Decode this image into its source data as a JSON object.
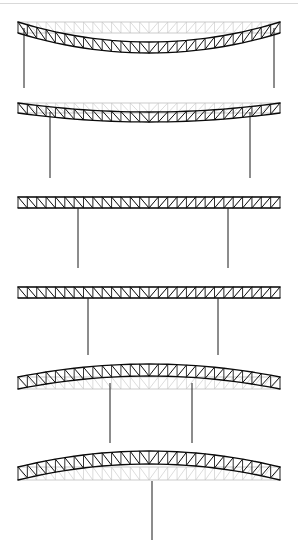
{
  "figure": {
    "width": 298,
    "height": 545,
    "background_color": "#ffffff",
    "reference_color": "#bcbcbc",
    "deformed_color": "#0a0a0a",
    "support_color": "#1a1a1a"
  },
  "chart_data": {
    "type": "line",
    "xlabel": "",
    "ylabel": "",
    "grid": false,
    "legend": [
      "undeformed reference truss",
      "deformed truss"
    ],
    "legend_position": "none",
    "xlim": [
      0,
      298
    ],
    "ylim": [
      0,
      545
    ],
    "series": [
      {
        "name": "panel-1-top-chord-deformed",
        "x": [
          18,
          46,
          74,
          102,
          130,
          158,
          186,
          214,
          242,
          270
        ],
        "y": [
          24,
          30,
          36,
          40,
          42,
          42,
          40,
          36,
          30,
          24
        ]
      },
      {
        "name": "panel-1-bottom-chord-deformed",
        "x": [
          18,
          46,
          74,
          102,
          130,
          158,
          186,
          214,
          242,
          270
        ],
        "y": [
          34,
          40,
          46,
          50,
          52,
          52,
          50,
          46,
          40,
          34
        ]
      },
      {
        "name": "panel-2-top-chord-deformed",
        "x": [
          18,
          46,
          74,
          102,
          130,
          158,
          186,
          214,
          242,
          270
        ],
        "y": [
          105,
          108,
          111,
          113,
          114,
          114,
          113,
          111,
          108,
          105
        ]
      },
      {
        "name": "panel-3-top-chord-deformed",
        "x": [
          18,
          46,
          74,
          102,
          130,
          158,
          186,
          214,
          242,
          270
        ],
        "y": [
          199,
          199,
          199,
          199,
          199,
          199,
          199,
          199,
          199,
          199
        ]
      },
      {
        "name": "panel-4-top-chord-deformed",
        "x": [
          18,
          46,
          74,
          102,
          130,
          158,
          186,
          214,
          242,
          270
        ],
        "y": [
          289,
          289,
          289,
          289,
          289,
          289,
          289,
          289,
          289,
          289
        ]
      },
      {
        "name": "panel-5-top-chord-deformed",
        "x": [
          18,
          46,
          74,
          102,
          130,
          158,
          186,
          214,
          242,
          270
        ],
        "y": [
          390,
          386,
          382,
          379,
          377,
          377,
          379,
          382,
          386,
          390
        ]
      },
      {
        "name": "panel-6-top-chord-deformed",
        "x": [
          18,
          46,
          74,
          102,
          130,
          158,
          186,
          214,
          242,
          270
        ],
        "y": [
          489,
          484,
          480,
          477,
          475,
          475,
          477,
          480,
          484,
          489
        ]
      }
    ]
  },
  "panels": [
    {
      "id": "panel-1",
      "name": "simply-supported-end-columns-sagging",
      "label": "Diagram 1",
      "span_left": 18,
      "span_right": 280,
      "reference_top_y": 22,
      "reference_depth": 11,
      "bays": 28,
      "camber": 20,
      "camber_direction": "sag",
      "columns": [
        {
          "x": 24,
          "top": 28,
          "bottom": 88
        },
        {
          "x": 274,
          "top": 28,
          "bottom": 88
        }
      ]
    },
    {
      "id": "panel-2",
      "name": "two-interior-columns-slight-sag",
      "label": "Diagram 2",
      "span_left": 18,
      "span_right": 280,
      "reference_top_y": 103,
      "reference_depth": 10,
      "bays": 28,
      "camber": 9,
      "camber_direction": "sag",
      "columns": [
        {
          "x": 50,
          "top": 112,
          "bottom": 178
        },
        {
          "x": 250,
          "top": 112,
          "bottom": 178
        }
      ]
    },
    {
      "id": "panel-3",
      "name": "two-interior-columns-straight",
      "label": "Diagram 3",
      "span_left": 18,
      "span_right": 280,
      "reference_top_y": 197,
      "reference_depth": 11,
      "bays": 28,
      "camber": 0,
      "camber_direction": "none",
      "columns": [
        {
          "x": 78,
          "top": 208,
          "bottom": 268
        },
        {
          "x": 228,
          "top": 208,
          "bottom": 268
        }
      ]
    },
    {
      "id": "panel-4",
      "name": "two-interior-columns-straight-wide",
      "label": "Diagram 4",
      "span_left": 18,
      "span_right": 280,
      "reference_top_y": 287,
      "reference_depth": 11,
      "bays": 28,
      "camber": 0,
      "camber_direction": "none",
      "columns": [
        {
          "x": 88,
          "top": 298,
          "bottom": 355
        },
        {
          "x": 218,
          "top": 298,
          "bottom": 355
        }
      ]
    },
    {
      "id": "panel-5",
      "name": "two-interior-columns-hogging",
      "label": "Diagram 5",
      "span_left": 18,
      "span_right": 280,
      "reference_top_y": 377,
      "reference_depth": 12,
      "bays": 28,
      "camber": 13,
      "camber_direction": "hog",
      "columns": [
        {
          "x": 110,
          "top": 383,
          "bottom": 443
        },
        {
          "x": 192,
          "top": 383,
          "bottom": 443
        }
      ]
    },
    {
      "id": "panel-6",
      "name": "single-central-column-hogging",
      "label": "Diagram 6",
      "span_left": 18,
      "span_right": 280,
      "reference_top_y": 467,
      "reference_depth": 13,
      "bays": 28,
      "camber": 16,
      "camber_direction": "hog",
      "columns": [
        {
          "x": 152,
          "top": 481,
          "bottom": 540
        }
      ]
    }
  ]
}
